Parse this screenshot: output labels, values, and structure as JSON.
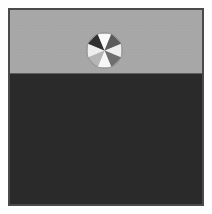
{
  "figure": {
    "name": "beach-ball-on-horizon",
    "width": 212,
    "height": 214,
    "page_background": "#fefefe",
    "caption": ""
  },
  "frame": {
    "border_color": "#4a4a4a",
    "border_width": 2,
    "margin": 8
  },
  "scene": {
    "sky": {
      "label": "sky",
      "color": "#a9a9a9",
      "height_fraction": 0.33
    },
    "ground": {
      "label": "ground",
      "color": "#282828",
      "height_fraction": 0.67
    },
    "horizon": {
      "label": "horizon-line",
      "color": "#5d5d5d",
      "y": 64
    }
  },
  "ball": {
    "label": "beach ball",
    "center_x": 104,
    "center_y": 50,
    "diameter": 37,
    "segment_count": 8,
    "outline_color": "#8a8a8a",
    "segments": [
      {
        "index": 0,
        "color": "#f2f2f2",
        "tone": "white"
      },
      {
        "index": 1,
        "color": "#6e6e6e",
        "tone": "mid-gray"
      },
      {
        "index": 2,
        "color": "#fafafa",
        "tone": "white"
      },
      {
        "index": 3,
        "color": "#b8b8b8",
        "tone": "light-gray"
      },
      {
        "index": 4,
        "color": "#f2f2f2",
        "tone": "white"
      },
      {
        "index": 5,
        "color": "#2e2e2e",
        "tone": "dark"
      },
      {
        "index": 6,
        "color": "#fdfdfd",
        "tone": "white"
      },
      {
        "index": 7,
        "color": "#5a5a5a",
        "tone": "mid-gray"
      }
    ]
  }
}
